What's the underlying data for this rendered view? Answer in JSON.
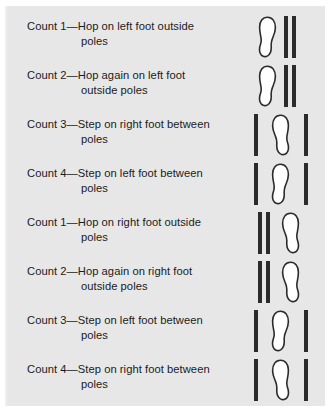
{
  "figure": {
    "background_color": "#e7e7e7",
    "ink_color": "#2b2b2b",
    "text_color": "#1b1b1b",
    "rows": [
      {
        "line1": "Count 1—Hop on left foot outside",
        "line2": "poles",
        "diagram": "foot-left-two-poles-right",
        "foot": "left-foot",
        "pole_count": 2
      },
      {
        "line1": "Count 2—Hop again on left foot",
        "line2": "outside poles",
        "diagram": "foot-left-two-poles-right",
        "foot": "left-foot",
        "pole_count": 2
      },
      {
        "line1": "Count 3—Step on right foot between",
        "line2": "poles",
        "diagram": "pole-foot-pole",
        "foot": "right-foot",
        "pole_count": 2
      },
      {
        "line1": "Count 4—Step on left foot between",
        "line2": "poles",
        "diagram": "pole-foot-pole",
        "foot": "left-foot",
        "pole_count": 2
      },
      {
        "line1": "Count 1—Hop on right foot outside",
        "line2": "poles",
        "diagram": "two-poles-left-foot-right",
        "foot": "right-foot",
        "pole_count": 2
      },
      {
        "line1": "Count 2—Hop again on right foot",
        "line2": "outside poles",
        "diagram": "two-poles-left-foot-right",
        "foot": "right-foot",
        "pole_count": 2
      },
      {
        "line1": "Count 3—Step on left foot between",
        "line2": "poles",
        "diagram": "pole-foot-pole",
        "foot": "left-foot",
        "pole_count": 2
      },
      {
        "line1": "Count 4—Step on right foot between",
        "line2": "poles",
        "diagram": "pole-foot-pole",
        "foot": "right-foot",
        "pole_count": 2
      }
    ]
  }
}
